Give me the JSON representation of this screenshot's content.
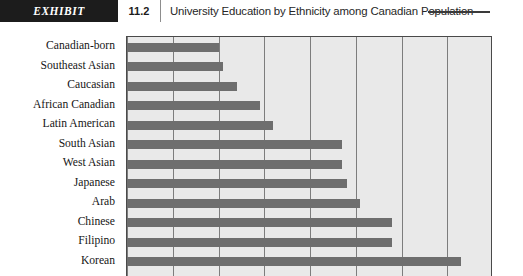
{
  "header": {
    "exhibit_tag": "EXHIBIT",
    "exhibit_number": "11.2",
    "title": "University Education by Ethnicity among Canadian Population"
  },
  "chart_data": {
    "type": "bar",
    "orientation": "horizontal",
    "title": "University Education by Ethnicity among Canadian Population",
    "xlabel": "",
    "ylabel": "",
    "grid": true,
    "legend": null,
    "xlim": [
      0,
      80
    ],
    "xticks": [
      0,
      10,
      20,
      30,
      40,
      50,
      60,
      70,
      80
    ],
    "categories": [
      "Canadian-born",
      "Southeast Asian",
      "Caucasian",
      "African Canadian",
      "Latin American",
      "South Asian",
      "West Asian",
      "Japanese",
      "Arab",
      "Chinese",
      "Filipino",
      "Korean"
    ],
    "values": [
      20,
      21,
      24,
      29,
      32,
      47,
      47,
      48,
      51,
      58,
      58,
      73
    ],
    "bar_color": "#6e6e6e",
    "plot_background": "#e9e9e9"
  }
}
